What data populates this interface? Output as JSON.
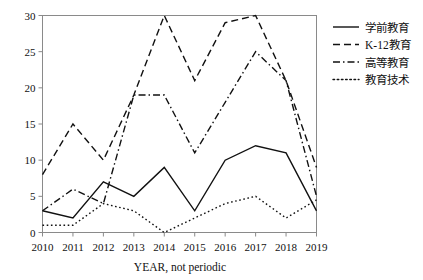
{
  "chart_data": {
    "type": "line",
    "title": "",
    "xlabel": "YEAR, not periodic",
    "ylabel": "",
    "categories": [
      "2010",
      "2011",
      "2012",
      "2013",
      "2014",
      "2015",
      "2016",
      "2017",
      "2018",
      "2019"
    ],
    "xlim": [
      2010,
      2019
    ],
    "ylim": [
      0,
      30
    ],
    "yticks": [
      0,
      5,
      10,
      15,
      20,
      25,
      30
    ],
    "grid": false,
    "legend_position": "right",
    "series": [
      {
        "name": "学前教育",
        "style": "solid",
        "values": [
          3,
          2,
          7,
          5,
          9,
          3,
          10,
          12,
          11,
          3
        ]
      },
      {
        "name": "K-12教育",
        "style": "dashed",
        "values": [
          8,
          15,
          10,
          19,
          30,
          21,
          29,
          30,
          21,
          9
        ]
      },
      {
        "name": "高等教育",
        "style": "dashdot",
        "values": [
          3,
          6,
          4,
          19,
          19,
          11,
          18,
          25,
          21,
          5
        ]
      },
      {
        "name": "教育技术",
        "style": "dotted",
        "values": [
          1,
          1,
          4,
          3,
          0,
          2,
          4,
          5,
          2,
          4.5
        ]
      }
    ]
  },
  "axis": {
    "x_tick_labels": [
      "2010",
      "2011",
      "2012",
      "2013",
      "2014",
      "2015",
      "2016",
      "2017",
      "2018",
      "2019"
    ],
    "y_tick_labels": [
      "0",
      "5",
      "10",
      "15",
      "20",
      "25",
      "30"
    ],
    "x_title": "YEAR, not periodic"
  },
  "legend": {
    "entries": [
      {
        "label": "学前教育",
        "style": "solid"
      },
      {
        "label": "K-12教育",
        "style": "dashed"
      },
      {
        "label": "高等教育",
        "style": "dashdot"
      },
      {
        "label": "教育技术",
        "style": "dotted"
      }
    ]
  },
  "colors": {
    "line": "#111111",
    "frame": "#8a8a8a",
    "background": "#ffffff"
  }
}
